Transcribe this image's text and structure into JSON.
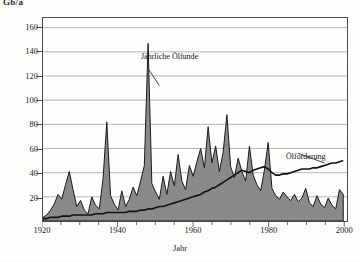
{
  "axis": {
    "y_unit": "Gb/a",
    "x_title": "Jahr",
    "y_ticks": [
      20,
      40,
      60,
      80,
      100,
      120,
      140,
      160
    ],
    "x_ticks": [
      1920,
      1940,
      1960,
      1980,
      2000
    ]
  },
  "annotations": {
    "discoveries": "Jährliche Ölfunde",
    "production": "Ölförderung"
  },
  "colors": {
    "fill": "#8a8a8a",
    "outline": "#1a1a1a",
    "frame": "#4a4a4a",
    "grid": "#9a9a9a",
    "production_line": "#111111",
    "background": "#ffffff"
  },
  "chart_data": {
    "type": "area",
    "title": "",
    "subtitle": "",
    "xlabel": "Jahr",
    "ylabel": "Gb/a",
    "xlim": [
      1920,
      2001
    ],
    "ylim": [
      0,
      168
    ],
    "grid": true,
    "legend": "inline-annotations",
    "x": [
      1920,
      1921,
      1922,
      1923,
      1924,
      1925,
      1926,
      1927,
      1928,
      1929,
      1930,
      1931,
      1932,
      1933,
      1934,
      1935,
      1936,
      1937,
      1938,
      1939,
      1940,
      1941,
      1942,
      1943,
      1944,
      1945,
      1946,
      1947,
      1948,
      1949,
      1950,
      1951,
      1952,
      1953,
      1954,
      1955,
      1956,
      1957,
      1958,
      1959,
      1960,
      1961,
      1962,
      1963,
      1964,
      1965,
      1966,
      1967,
      1968,
      1969,
      1970,
      1971,
      1972,
      1973,
      1974,
      1975,
      1976,
      1977,
      1978,
      1979,
      1980,
      1981,
      1982,
      1983,
      1984,
      1985,
      1986,
      1987,
      1988,
      1989,
      1990,
      1991,
      1992,
      1993,
      1994,
      1995,
      1996,
      1997,
      1998,
      1999,
      2000
    ],
    "series": [
      {
        "name": "Jährliche Ölfunde",
        "type": "area",
        "values": [
          3,
          5,
          9,
          14,
          22,
          18,
          30,
          41,
          26,
          12,
          17,
          9,
          6,
          20,
          13,
          10,
          35,
          82,
          21,
          14,
          9,
          25,
          12,
          18,
          28,
          21,
          33,
          46,
          147,
          31,
          24,
          18,
          37,
          22,
          41,
          29,
          55,
          33,
          26,
          46,
          37,
          49,
          60,
          44,
          78,
          48,
          62,
          41,
          57,
          88,
          45,
          36,
          52,
          41,
          33,
          62,
          38,
          30,
          25,
          42,
          65,
          27,
          21,
          18,
          24,
          20,
          17,
          22,
          16,
          19,
          27,
          15,
          12,
          21,
          14,
          11,
          19,
          13,
          10,
          26,
          22
        ]
      },
      {
        "name": "Ölförderung",
        "type": "line",
        "values": [
          2,
          2,
          3,
          3,
          3,
          4,
          4,
          4,
          5,
          5,
          5,
          5,
          5,
          5,
          6,
          6,
          6,
          7,
          7,
          7,
          7,
          7,
          7,
          8,
          8,
          8,
          9,
          9,
          10,
          10,
          11,
          12,
          12,
          13,
          14,
          15,
          16,
          17,
          18,
          19,
          20,
          21,
          22,
          24,
          25,
          27,
          28,
          30,
          32,
          34,
          36,
          38,
          40,
          42,
          41,
          40,
          42,
          43,
          44,
          45,
          43,
          40,
          38,
          38,
          39,
          39,
          40,
          41,
          42,
          43,
          43,
          43,
          44,
          44,
          45,
          46,
          47,
          48,
          48,
          49,
          50
        ]
      }
    ]
  }
}
